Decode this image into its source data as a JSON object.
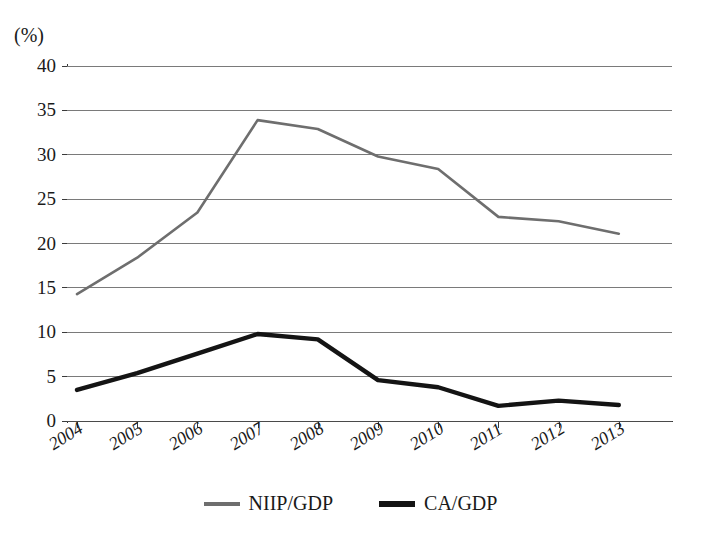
{
  "chart_data": {
    "type": "line",
    "title": "",
    "subtitle": "",
    "unit_label": "(%)",
    "xlabel": "",
    "ylabel": "",
    "ylim": [
      0,
      40
    ],
    "ytick_step": 5,
    "yticks": [
      "40",
      "35",
      "30",
      "25",
      "20",
      "15",
      "10",
      "5",
      "0"
    ],
    "grid": true,
    "legend_position": "bottom",
    "categories": [
      "2004",
      "2005",
      "2006",
      "2007",
      "2008",
      "2009",
      "2010",
      "2011",
      "2012",
      "2013"
    ],
    "series": [
      {
        "name": "NIIP/GDP",
        "color": "#6e6e6e",
        "width": 2.6,
        "values": [
          14.3,
          18.4,
          23.5,
          33.9,
          32.9,
          29.8,
          28.4,
          23.0,
          22.5,
          21.1
        ]
      },
      {
        "name": "CA/GDP",
        "color": "#141414",
        "width": 4.4,
        "values": [
          3.5,
          5.4,
          7.6,
          9.8,
          9.2,
          4.6,
          3.8,
          1.7,
          2.3,
          1.8
        ]
      }
    ]
  },
  "legend": {
    "items": [
      {
        "label": "NIIP/GDP",
        "swatch": "gray-line-swatch"
      },
      {
        "label": "CA/GDP",
        "swatch": "black-line-swatch"
      }
    ]
  },
  "colors": {
    "series_niip": "#6e6e6e",
    "series_ca": "#141414",
    "gridline": "#7a7a7a",
    "axis": "#3a3a3a",
    "text": "#1a1a1a",
    "background": "#ffffff"
  }
}
